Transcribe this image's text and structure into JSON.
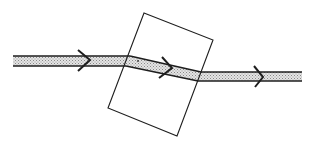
{
  "diagram": {
    "colors": {
      "background": "#ffffff",
      "stroke": "#1e1e1e",
      "beam_fill": "#c9c9c9",
      "beam_dot": "#d8d8d8"
    },
    "slab": {
      "shape": "rotated-rectangle",
      "corners": [
        [
          144,
          13
        ],
        [
          213,
          40
        ],
        [
          177,
          136
        ],
        [
          108,
          108
        ]
      ]
    },
    "beams": [
      {
        "name": "incident-ray",
        "top": [
          [
            13,
            56
          ],
          [
            130,
            56
          ]
        ],
        "bottom": [
          [
            13,
            66
          ],
          [
            126,
            66
          ]
        ]
      },
      {
        "name": "refracted-ray",
        "top": [
          [
            130,
            56
          ],
          [
            201,
            72
          ]
        ],
        "bottom": [
          [
            126,
            66
          ],
          [
            198,
            81
          ]
        ]
      },
      {
        "name": "emergent-ray",
        "top": [
          [
            201,
            72
          ],
          [
            302,
            72
          ]
        ],
        "bottom": [
          [
            198,
            81
          ],
          [
            302,
            81
          ]
        ]
      }
    ],
    "arrows": [
      {
        "name": "incident-direction",
        "points": [
          [
            78,
            50
          ],
          [
            90,
            60
          ],
          [
            78,
            71
          ]
        ]
      },
      {
        "name": "refracted-direction",
        "points": [
          [
            162,
            57
          ],
          [
            172,
            68
          ],
          [
            159,
            78
          ]
        ]
      },
      {
        "name": "emergent-direction",
        "points": [
          [
            254,
            66
          ],
          [
            263,
            77
          ],
          [
            255,
            87
          ]
        ]
      }
    ],
    "marker": {
      "name": "entry-dot",
      "x": 138,
      "y": 61
    }
  }
}
